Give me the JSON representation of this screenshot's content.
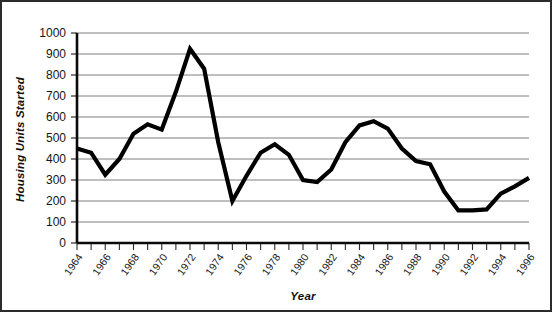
{
  "chart_data": {
    "type": "line",
    "title": "",
    "xlabel": "Year",
    "ylabel": "Housing Units Started",
    "xlim": [
      1964,
      1996
    ],
    "ylim": [
      0,
      1000
    ],
    "grid": true,
    "legend": "none",
    "y_ticks": [
      0,
      100,
      200,
      300,
      400,
      500,
      600,
      700,
      800,
      900,
      1000
    ],
    "y_tick_labels": [
      "0",
      "100",
      "200",
      "300",
      "400",
      "500",
      "600",
      "700",
      "800",
      "900",
      "1000"
    ],
    "x_tick_labels": [
      "1964",
      "1966",
      "1968",
      "1970",
      "1972",
      "1974",
      "1976",
      "1978",
      "1980",
      "1982",
      "1984",
      "1986",
      "1988",
      "1990",
      "1992",
      "1994",
      "1996"
    ],
    "x_tick_label_step": 2,
    "x_minor_ticks_every": 1,
    "x": [
      1964,
      1965,
      1966,
      1967,
      1968,
      1969,
      1970,
      1971,
      1972,
      1973,
      1974,
      1975,
      1976,
      1977,
      1978,
      1979,
      1980,
      1981,
      1982,
      1983,
      1984,
      1985,
      1986,
      1987,
      1988,
      1989,
      1990,
      1991,
      1992,
      1993,
      1994,
      1995,
      1996
    ],
    "values": [
      450,
      430,
      325,
      400,
      520,
      565,
      540,
      720,
      925,
      830,
      480,
      200,
      320,
      430,
      470,
      420,
      300,
      290,
      350,
      480,
      560,
      580,
      545,
      450,
      390,
      375,
      245,
      155,
      155,
      160,
      235,
      270,
      310
    ],
    "series": [
      {
        "name": "Housing Units Started",
        "color": "#000000",
        "values": [
          450,
          430,
          325,
          400,
          520,
          565,
          540,
          720,
          925,
          830,
          480,
          200,
          320,
          430,
          470,
          420,
          300,
          290,
          350,
          480,
          560,
          580,
          545,
          450,
          390,
          375,
          245,
          155,
          155,
          160,
          235,
          270,
          310
        ]
      }
    ]
  }
}
